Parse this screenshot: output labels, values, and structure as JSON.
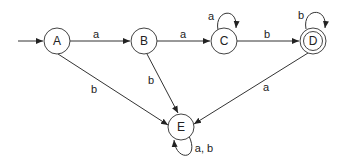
{
  "diagram": {
    "type": "finite-automaton",
    "start_state": "A",
    "states": [
      {
        "id": "A",
        "label": "A",
        "x": 57,
        "y": 41,
        "accepting": false
      },
      {
        "id": "B",
        "label": "B",
        "x": 144,
        "y": 41,
        "accepting": false
      },
      {
        "id": "C",
        "label": "C",
        "x": 224,
        "y": 41,
        "accepting": false
      },
      {
        "id": "D",
        "label": "D",
        "x": 313,
        "y": 41,
        "accepting": true
      },
      {
        "id": "E",
        "label": "E",
        "x": 181,
        "y": 127,
        "accepting": false
      }
    ],
    "transitions": [
      {
        "from": "A",
        "to": "B",
        "label": "a"
      },
      {
        "from": "B",
        "to": "C",
        "label": "a"
      },
      {
        "from": "C",
        "to": "C",
        "label": "a"
      },
      {
        "from": "C",
        "to": "D",
        "label": "b"
      },
      {
        "from": "D",
        "to": "D",
        "label": "b"
      },
      {
        "from": "A",
        "to": "E",
        "label": "b"
      },
      {
        "from": "B",
        "to": "E",
        "label": "b"
      },
      {
        "from": "D",
        "to": "E",
        "label": "a"
      },
      {
        "from": "E",
        "to": "E",
        "label": "a, b"
      }
    ]
  }
}
